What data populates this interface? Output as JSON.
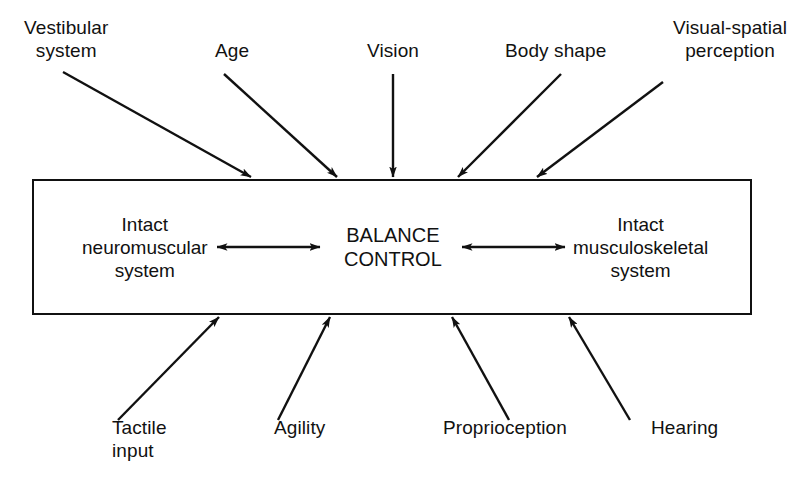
{
  "diagram": {
    "stroke_color": "#111111",
    "background_color": "#ffffff",
    "box": {
      "name": "balance-control-box",
      "x": 32,
      "y": 179,
      "width": 720,
      "height": 136,
      "border_width": 2
    },
    "center_node": {
      "label": "BALANCE\nCONTROL",
      "x": 393,
      "y": 247
    },
    "inner_nodes": [
      {
        "id": "neuromuscular",
        "label": "Intact\nneuromuscular\nsystem",
        "x": 145,
        "y": 247
      },
      {
        "id": "musculoskeletal",
        "label": "Intact\nmusculoskeletal\nsystem",
        "x": 640,
        "y": 247
      }
    ],
    "inner_arrows": [
      {
        "id": "neuromuscular-balance",
        "type": "double-headed",
        "x1": 217,
        "y1": 247,
        "x2": 320,
        "y2": 247
      },
      {
        "id": "balance-musculoskeletal",
        "type": "double-headed",
        "x1": 462,
        "y1": 247,
        "x2": 565,
        "y2": 247
      }
    ],
    "top_inputs": [
      {
        "id": "vestibular-system",
        "label": "Vestibular\nsystem",
        "label_x": 66,
        "label_y": 32,
        "arrow": {
          "x1": 63,
          "y1": 72,
          "x2": 251,
          "y2": 177
        }
      },
      {
        "id": "age",
        "label": "Age",
        "label_x": 232,
        "label_y": 55,
        "arrow": {
          "x1": 224,
          "y1": 74,
          "x2": 337,
          "y2": 177
        }
      },
      {
        "id": "vision",
        "label": "Vision",
        "label_x": 393,
        "label_y": 55,
        "arrow": {
          "x1": 393,
          "y1": 74,
          "x2": 393,
          "y2": 177
        }
      },
      {
        "id": "body-shape",
        "label": "Body shape",
        "label_x": 555,
        "label_y": 55,
        "arrow": {
          "x1": 561,
          "y1": 74,
          "x2": 458,
          "y2": 177
        }
      },
      {
        "id": "visual-spatial-perception",
        "label": "Visual-spatial\nperception",
        "label_x": 730,
        "label_y": 32,
        "arrow": {
          "x1": 663,
          "y1": 82,
          "x2": 537,
          "y2": 177
        }
      }
    ],
    "bottom_inputs": [
      {
        "id": "tactile-input",
        "label": "Tactile\ninput",
        "label_x": 112,
        "label_y": 428,
        "label_align": "left",
        "arrow": {
          "x1": 118,
          "y1": 420,
          "x2": 219,
          "y2": 317
        }
      },
      {
        "id": "agility",
        "label": "Agility",
        "label_x": 274,
        "label_y": 428,
        "label_align": "left",
        "arrow": {
          "x1": 278,
          "y1": 420,
          "x2": 330,
          "y2": 317
        }
      },
      {
        "id": "proprioception",
        "label": "Proprioception",
        "label_x": 443,
        "label_y": 428,
        "label_align": "left",
        "arrow": {
          "x1": 509,
          "y1": 420,
          "x2": 452,
          "y2": 317
        }
      },
      {
        "id": "hearing",
        "label": "Hearing",
        "label_x": 651,
        "label_y": 428,
        "label_align": "left",
        "arrow": {
          "x1": 630,
          "y1": 420,
          "x2": 569,
          "y2": 317
        }
      }
    ]
  }
}
